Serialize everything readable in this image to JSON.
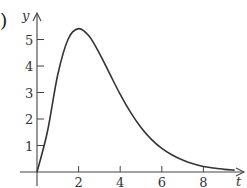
{
  "figure": {
    "subfigure_label_fragment": ")",
    "top_cutoff_text_visible": false
  },
  "chart_data": {
    "type": "line",
    "title": "",
    "xlabel": "t",
    "ylabel": "y",
    "xlim": [
      0,
      9.8
    ],
    "ylim": [
      0,
      6
    ],
    "x_ticks": [
      2,
      4,
      6,
      8
    ],
    "x_tick_labels": [
      "2",
      "4",
      "6",
      "8"
    ],
    "y_ticks": [
      1,
      2,
      3,
      4,
      5
    ],
    "y_tick_labels": [
      "1",
      "2",
      "3",
      "4",
      "5"
    ],
    "grid": false,
    "legend": null,
    "series": [
      {
        "name": "y(t)",
        "x": [
          0,
          0.5,
          1,
          1.5,
          2,
          2.5,
          3,
          3.5,
          4,
          4.5,
          5,
          5.5,
          6,
          6.5,
          7,
          7.5,
          8,
          8.5,
          9,
          9.5
        ],
        "values": [
          0,
          1.52,
          3.68,
          5.02,
          5.41,
          5.13,
          4.48,
          3.7,
          2.93,
          2.25,
          1.68,
          1.23,
          0.89,
          0.64,
          0.45,
          0.31,
          0.21,
          0.15,
          0.1,
          0.07
        ]
      }
    ],
    "annotations": [
      "peak near t = 2, y ≈ 5.4"
    ]
  },
  "style": {
    "axis_color": "#444444",
    "curve_color": "#333333"
  }
}
